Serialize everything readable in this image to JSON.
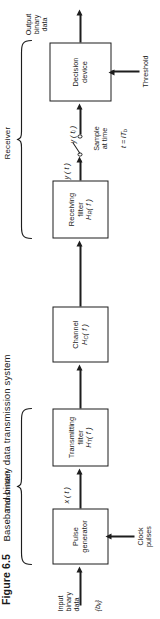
{
  "figure": {
    "number": "Figure 6.5",
    "caption": "Baseband binary data transmission system"
  },
  "sections": [
    {
      "name": "transmitter",
      "label": "Transmitter"
    },
    {
      "name": "receiver",
      "label": "Receiver"
    }
  ],
  "blocks": [
    {
      "name": "pulse-generator",
      "line1": "Pulse",
      "line2": "generator",
      "line3": ""
    },
    {
      "name": "transmitting-filter",
      "line1": "Transmitting",
      "line2": "filter",
      "line3": "H",
      "sub": "T",
      "arg": "( f )"
    },
    {
      "name": "channel",
      "line1": "Channel",
      "line2": "",
      "line3": "H",
      "sub": "C",
      "arg": "( f )"
    },
    {
      "name": "receiving-filter",
      "line1": "Receiving",
      "line2": "filter",
      "line3": "H",
      "sub": "R",
      "arg": "( f )"
    },
    {
      "name": "decision-device",
      "line1": "Decision",
      "line2": "device",
      "line3": ""
    }
  ],
  "labels": {
    "input": "Input\nbinary\ndata",
    "input_sequence": "{b",
    "input_sequence_sub": "k",
    "input_sequence_close": "}",
    "clock": "Clock\npulses",
    "x_of_t": "x ( t )",
    "y_of_t": "y ( t )",
    "y_of_ti": "y ( t",
    "y_of_ti_sub": "i",
    "y_of_ti_close": " )",
    "sample": "Sample\nat time",
    "sample_time": "t = iT",
    "sample_time_sub": "b",
    "threshold": "Threshold",
    "output": "Output\nbinary\ndata"
  },
  "colors": {
    "ink": "#1d1d1d",
    "paper": "#ffffff"
  }
}
